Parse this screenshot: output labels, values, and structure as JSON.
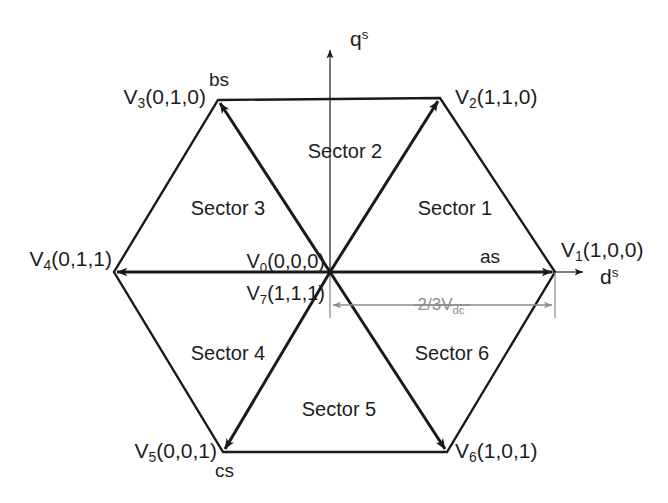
{
  "figure": {
    "type": "space-vector-hexagon",
    "background_color": "#ffffff",
    "line_color": "#1a1a1a",
    "dimension_color": "#8d8d8d"
  },
  "axes": {
    "horizontal": {
      "label_main": "d",
      "label_sup": "s"
    },
    "vertical": {
      "label_main": "q",
      "label_sup": "s"
    }
  },
  "phase_axes": [
    {
      "id": "as",
      "label": "as"
    },
    {
      "id": "bs",
      "label": "bs"
    },
    {
      "id": "cs",
      "label": "cs"
    }
  ],
  "vectors": [
    {
      "id": "V1",
      "name": "V",
      "index": "1",
      "states": "(1,0,0)",
      "label": "V1(1,0,0)",
      "angle_deg": 0
    },
    {
      "id": "V2",
      "name": "V",
      "index": "2",
      "states": "(1,1,0)",
      "label": "V2(1,1,0)",
      "angle_deg": 60
    },
    {
      "id": "V3",
      "name": "V",
      "index": "3",
      "states": "(0,1,0)",
      "label": "V3(0,1,0)",
      "angle_deg": 120
    },
    {
      "id": "V4",
      "name": "V",
      "index": "4",
      "states": "(0,1,1)",
      "label": "V4(0,1,1)",
      "angle_deg": 180
    },
    {
      "id": "V5",
      "name": "V",
      "index": "5",
      "states": "(0,0,1)",
      "label": "V5(0,0,1)",
      "angle_deg": 240
    },
    {
      "id": "V6",
      "name": "V",
      "index": "6",
      "states": "(1,0,1)",
      "label": "V6(1,0,1)",
      "angle_deg": 300
    }
  ],
  "zero_vectors": [
    {
      "id": "V0",
      "name": "V",
      "index": "0",
      "states": "(0,0,0)",
      "label": "V0(0,0,0)"
    },
    {
      "id": "V7",
      "name": "V",
      "index": "7",
      "states": "(1,1,1)",
      "label": "V7(1,1,1)"
    }
  ],
  "sectors": [
    {
      "id": "sector1",
      "label": "Sector 1"
    },
    {
      "id": "sector2",
      "label": "Sector 2"
    },
    {
      "id": "sector3",
      "label": "Sector 3"
    },
    {
      "id": "sector4",
      "label": "Sector 4"
    },
    {
      "id": "sector5",
      "label": "Sector 5"
    },
    {
      "id": "sector6",
      "label": "Sector 6"
    }
  ],
  "dimension": {
    "numerator_text": "2/3",
    "symbol": "V",
    "subscript": "dc",
    "label": "2/3 Vdc"
  }
}
